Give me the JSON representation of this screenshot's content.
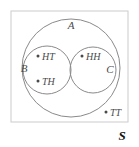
{
  "figure": {
    "type": "venn-diagram",
    "universe_label": "S",
    "background_color": "#ffffff",
    "stroke_color": "#8a8a8a",
    "rect_stroke_color": "#d0d0d0",
    "label_color": "#4a4a4a"
  },
  "sets": [
    {
      "id": "A",
      "label": "A",
      "label_x": 71,
      "label_y": 29,
      "cx": 71,
      "cy": 68,
      "r": 49
    },
    {
      "id": "B",
      "label": "B",
      "label_x": 24,
      "label_y": 72,
      "cx": 47,
      "cy": 70,
      "r": 24
    },
    {
      "id": "C",
      "label": "C",
      "label_x": 110,
      "label_y": 73,
      "cx": 93,
      "cy": 70,
      "r": 23
    }
  ],
  "points": [
    {
      "id": "HT",
      "label": "HT",
      "dot_x": 38,
      "dot_y": 56,
      "text_x": 42,
      "text_y": 60,
      "member_of": "B"
    },
    {
      "id": "TH",
      "label": "TH",
      "dot_x": 38,
      "dot_y": 81,
      "text_x": 42,
      "text_y": 85,
      "member_of": "B"
    },
    {
      "id": "HH",
      "label": "HH",
      "dot_x": 82,
      "dot_y": 56,
      "text_x": 86,
      "text_y": 60,
      "member_of": "C"
    },
    {
      "id": "TT",
      "label": "TT",
      "dot_x": 106,
      "dot_y": 112,
      "text_x": 110,
      "text_y": 116,
      "member_of": "S"
    }
  ],
  "universe": {
    "rect_x": 11,
    "rect_y": 11,
    "rect_w": 117,
    "rect_h": 111,
    "label": "S",
    "label_x": 122,
    "label_y": 140
  }
}
